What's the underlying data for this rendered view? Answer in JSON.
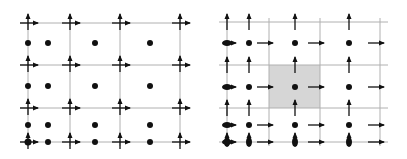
{
  "figure": {
    "width": 407,
    "height": 159,
    "colors": {
      "grid": "#b0b0b0",
      "ink": "#111111",
      "highlight": "#d6d6d6",
      "background": "#ffffff"
    }
  },
  "left_panel": {
    "name": "collocated-grid",
    "grid_x": [
      28,
      70,
      120,
      180
    ],
    "grid_y": [
      23,
      65,
      108,
      142
    ],
    "dots": [
      [
        28,
        43
      ],
      [
        48,
        43
      ],
      [
        95,
        43
      ],
      [
        150,
        43
      ],
      [
        28,
        86
      ],
      [
        48,
        86
      ],
      [
        95,
        86
      ],
      [
        150,
        86
      ],
      [
        28,
        125
      ],
      [
        48,
        125
      ],
      [
        95,
        125
      ],
      [
        150,
        125
      ],
      [
        48,
        142
      ],
      [
        95,
        142
      ],
      [
        150,
        142
      ]
    ],
    "vector_nodes": [
      [
        28,
        23
      ],
      [
        70,
        23
      ],
      [
        120,
        23
      ],
      [
        180,
        23
      ],
      [
        28,
        65
      ],
      [
        70,
        65
      ],
      [
        120,
        65
      ],
      [
        180,
        65
      ],
      [
        28,
        108
      ],
      [
        70,
        108
      ],
      [
        120,
        108
      ],
      [
        180,
        108
      ],
      [
        28,
        142
      ],
      [
        70,
        142
      ],
      [
        120,
        142
      ],
      [
        180,
        142
      ]
    ],
    "bold_node": [
      28,
      142
    ]
  },
  "right_panel": {
    "name": "staggered-grid",
    "grid_x": [
      227,
      269,
      320,
      380
    ],
    "grid_y": [
      22,
      65,
      108,
      142
    ],
    "highlight_cell": {
      "x": 269,
      "y": 65,
      "w": 51,
      "h": 43
    },
    "dots": [
      [
        249,
        43
      ],
      [
        295,
        43
      ],
      [
        349,
        43
      ],
      [
        249,
        87
      ],
      [
        295,
        87
      ],
      [
        349,
        87
      ],
      [
        249,
        125
      ],
      [
        295,
        125
      ],
      [
        349,
        125
      ]
    ],
    "up_arrows": [
      [
        227,
        22
      ],
      [
        249,
        22
      ],
      [
        295,
        22
      ],
      [
        349,
        22
      ],
      [
        227,
        65
      ],
      [
        249,
        65
      ],
      [
        295,
        65
      ],
      [
        349,
        65
      ],
      [
        227,
        108
      ],
      [
        249,
        108
      ],
      [
        295,
        108
      ],
      [
        349,
        108
      ]
    ],
    "right_arrows": [
      [
        265,
        43
      ],
      [
        316,
        43
      ],
      [
        376,
        43
      ],
      [
        265,
        87
      ],
      [
        316,
        87
      ],
      [
        376,
        87
      ],
      [
        265,
        125
      ],
      [
        316,
        125
      ],
      [
        376,
        125
      ],
      [
        265,
        142
      ],
      [
        316,
        142
      ],
      [
        376,
        142
      ]
    ],
    "bold_left_nodes": [
      [
        227,
        43
      ],
      [
        227,
        87
      ],
      [
        227,
        125
      ]
    ],
    "bold_bottom_nodes": [
      [
        227,
        142
      ],
      [
        249,
        142
      ],
      [
        295,
        142
      ],
      [
        349,
        142
      ]
    ]
  }
}
